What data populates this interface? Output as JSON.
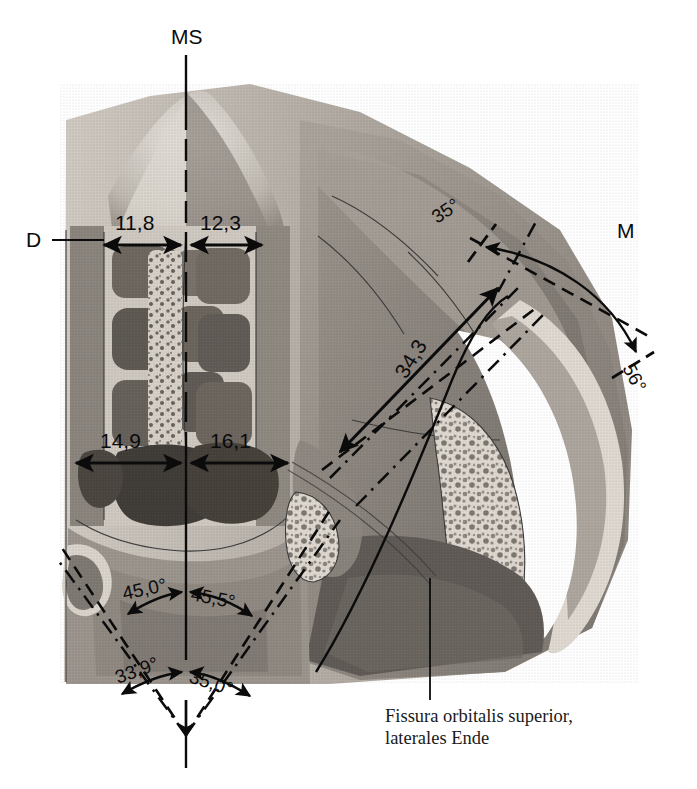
{
  "figure": {
    "kind": "anatomical-illustration",
    "background_color": "#ffffff",
    "ink_color": "#0b0b0b"
  },
  "axis_labels": {
    "ms": "MS",
    "d": "D",
    "m": "M"
  },
  "measurements": {
    "width_upper_left": "11,8",
    "width_upper_right": "12,3",
    "width_lower_left": "14,9",
    "width_lower_right": "16,1",
    "oblique_distance": "34,3"
  },
  "angles": {
    "upper_left": "45,0°",
    "upper_right": "45,5°",
    "lower_left": "33,9°",
    "lower_right": "35,0°",
    "lateral_start": "35°",
    "lateral_end": "56°"
  },
  "caption": {
    "line1": "Fissura orbitalis superior,",
    "line2": "laterales Ende"
  },
  "palette": {
    "bone_light": "#ded9d2",
    "bone_mid": "#b3aca4",
    "bone_dark": "#7e7770",
    "cavity_dark": "#56514c",
    "cavity_deep": "#3d3a36",
    "septum_white": "#f3f0ea",
    "tissue_gray": "#9a938c"
  }
}
